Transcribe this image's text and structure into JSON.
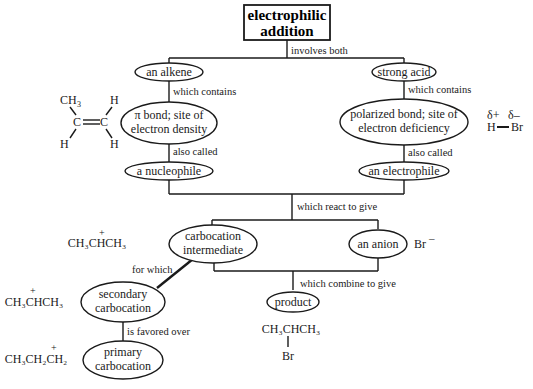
{
  "title": {
    "line1": "electrophilic",
    "line2": "addition"
  },
  "links": {
    "involves_both": "involves both",
    "which_contains_left": "which contains",
    "which_contains_right": "which contains",
    "also_called_left": "also called",
    "also_called_right": "also called",
    "which_react": "which react to give",
    "for_which": "for which",
    "which_combine": "which combine to give",
    "favored_over": "is favored over"
  },
  "nodes": {
    "alkene": "an alkene",
    "strong_acid": "strong acid",
    "pi_bond": {
      "line1": "π bond; site of",
      "line2": "electron density"
    },
    "polarized": {
      "line1": "polarized bond; site of",
      "line2": "electron deficiency"
    },
    "nucleophile": "a nucleophile",
    "electrophile": "an electrophile",
    "carbocation": {
      "line1": "carbocation",
      "line2": "intermediate"
    },
    "anion": "an anion",
    "secondary": {
      "line1": "secondary",
      "line2": "carbocation"
    },
    "primary": {
      "line1": "primary",
      "line2": "carbocation"
    },
    "product": "product"
  },
  "structures": {
    "propene": {
      "ch3": "CH",
      "ch3_sub": "3",
      "h_tr": "H",
      "h_bl": "H",
      "h_br": "H",
      "c": "C"
    },
    "hbr": {
      "delta_plus": "δ+",
      "delta_minus": "δ–",
      "h": "H",
      "br": "Br"
    },
    "bromide": {
      "br": "Br",
      "charge": "–"
    },
    "carbocation_intermediate": {
      "formula": "CH₃CHCH₃",
      "charge": "+"
    },
    "secondary_cation": {
      "formula": "CH₃CHCH₃",
      "charge": "+"
    },
    "primary_cation": {
      "formula": "CH₃CH₂CH₂",
      "charge": "+"
    },
    "product": {
      "formula": "CH₃CHCH₃",
      "substituent": "Br"
    }
  }
}
